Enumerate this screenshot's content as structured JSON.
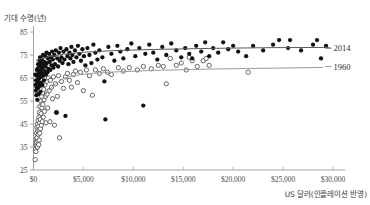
{
  "chart_data": {
    "type": "scatter",
    "title": "",
    "xlabel": "US 달러(인플레이션 반영)",
    "ylabel": "기대 수명(년)",
    "xlim": [
      0,
      30000
    ],
    "ylim": [
      25,
      85
    ],
    "xticks": [
      0,
      5000,
      10000,
      15000,
      20000,
      25000,
      30000
    ],
    "xtick_labels": [
      "$0",
      "$5,000",
      "$10,000",
      "$15,000",
      "$20,000",
      "$25,000",
      "$30,000"
    ],
    "yticks": [
      25,
      35,
      45,
      55,
      65,
      75,
      85
    ],
    "ytick_labels": [
      "25",
      "35",
      "45",
      "55",
      "65",
      "75",
      "85"
    ],
    "grid": false,
    "legend_position": "right-inline",
    "series": [
      {
        "name": "2014",
        "marker": "filled-circle",
        "color": "#111111",
        "label_x": 29400,
        "label_y": 78.0,
        "points": [
          [
            180,
            66.5
          ],
          [
            210,
            62.0
          ],
          [
            240,
            59.5
          ],
          [
            260,
            64.0
          ],
          [
            290,
            57.5
          ],
          [
            300,
            66.0
          ],
          [
            320,
            61.0
          ],
          [
            340,
            68.5
          ],
          [
            360,
            63.5
          ],
          [
            380,
            55.5
          ],
          [
            400,
            69.0
          ],
          [
            420,
            66.0
          ],
          [
            440,
            60.5
          ],
          [
            460,
            71.0
          ],
          [
            480,
            64.5
          ],
          [
            500,
            58.0
          ],
          [
            520,
            67.5
          ],
          [
            540,
            62.5
          ],
          [
            560,
            70.0
          ],
          [
            580,
            65.0
          ],
          [
            600,
            72.5
          ],
          [
            620,
            68.0
          ],
          [
            640,
            61.5
          ],
          [
            660,
            74.0
          ],
          [
            680,
            66.5
          ],
          [
            700,
            59.0
          ],
          [
            720,
            70.5
          ],
          [
            740,
            63.0
          ],
          [
            760,
            68.5
          ],
          [
            780,
            71.5
          ],
          [
            800,
            65.5
          ],
          [
            830,
            73.0
          ],
          [
            860,
            67.0
          ],
          [
            890,
            62.0
          ],
          [
            920,
            69.5
          ],
          [
            950,
            75.0
          ],
          [
            980,
            66.0
          ],
          [
            1010,
            71.0
          ],
          [
            1050,
            64.0
          ],
          [
            1090,
            72.0
          ],
          [
            1130,
            68.0
          ],
          [
            1170,
            74.5
          ],
          [
            1210,
            70.0
          ],
          [
            1250,
            66.5
          ],
          [
            1300,
            76.0
          ],
          [
            1350,
            71.5
          ],
          [
            1400,
            67.5
          ],
          [
            1450,
            73.5
          ],
          [
            1500,
            69.0
          ],
          [
            1560,
            75.5
          ],
          [
            1620,
            72.0
          ],
          [
            1680,
            68.5
          ],
          [
            1740,
            74.0
          ],
          [
            1800,
            70.5
          ],
          [
            1870,
            76.5
          ],
          [
            1930,
            73.0
          ],
          [
            2000,
            69.5
          ],
          [
            2080,
            75.0
          ],
          [
            2150,
            71.0
          ],
          [
            2230,
            77.0
          ],
          [
            2300,
            50.0
          ],
          [
            2380,
            73.5
          ],
          [
            2460,
            70.0
          ],
          [
            2540,
            76.0
          ],
          [
            2620,
            72.5
          ],
          [
            2700,
            78.0
          ],
          [
            2800,
            74.0
          ],
          [
            2900,
            71.5
          ],
          [
            3000,
            76.5
          ],
          [
            3100,
            73.0
          ],
          [
            3200,
            48.5
          ],
          [
            3300,
            77.5
          ],
          [
            3400,
            74.5
          ],
          [
            3500,
            71.0
          ],
          [
            3600,
            76.0
          ],
          [
            3700,
            73.5
          ],
          [
            3800,
            78.5
          ],
          [
            3900,
            75.0
          ],
          [
            4000,
            72.0
          ],
          [
            4150,
            77.0
          ],
          [
            4300,
            74.0
          ],
          [
            4450,
            79.0
          ],
          [
            4600,
            75.5
          ],
          [
            4750,
            72.5
          ],
          [
            4900,
            77.5
          ],
          [
            5050,
            74.5
          ],
          [
            5200,
            70.5
          ],
          [
            5400,
            78.0
          ],
          [
            5600,
            75.0
          ],
          [
            5800,
            71.5
          ],
          [
            6000,
            79.5
          ],
          [
            6200,
            76.0
          ],
          [
            6400,
            73.0
          ],
          [
            6600,
            77.0
          ],
          [
            6900,
            74.0
          ],
          [
            7100,
            63.5
          ],
          [
            7200,
            47.0
          ],
          [
            7500,
            78.5
          ],
          [
            7800,
            75.5
          ],
          [
            8100,
            72.5
          ],
          [
            8400,
            79.0
          ],
          [
            8700,
            76.5
          ],
          [
            9000,
            73.5
          ],
          [
            9400,
            77.5
          ],
          [
            9800,
            80.0
          ],
          [
            10200,
            74.5
          ],
          [
            10600,
            78.0
          ],
          [
            11000,
            53.0
          ],
          [
            11200,
            75.5
          ],
          [
            11600,
            79.5
          ],
          [
            12000,
            76.0
          ],
          [
            12400,
            73.0
          ],
          [
            12900,
            78.5
          ],
          [
            13300,
            75.0
          ],
          [
            13800,
            80.0
          ],
          [
            14300,
            77.0
          ],
          [
            14800,
            74.0
          ],
          [
            15200,
            78.0
          ],
          [
            15600,
            75.5
          ],
          [
            15900,
            73.5
          ],
          [
            16300,
            79.0
          ],
          [
            16800,
            76.5
          ],
          [
            17200,
            80.5
          ],
          [
            17600,
            74.5
          ],
          [
            18000,
            78.0
          ],
          [
            18500,
            76.0
          ],
          [
            19000,
            80.5
          ],
          [
            19500,
            77.5
          ],
          [
            20000,
            79.0
          ],
          [
            20500,
            76.5
          ],
          [
            21300,
            74.5
          ],
          [
            22000,
            79.0
          ],
          [
            23000,
            77.0
          ],
          [
            24000,
            79.5
          ],
          [
            24600,
            81.5
          ],
          [
            25500,
            78.0
          ],
          [
            25700,
            81.5
          ],
          [
            26800,
            77.0
          ],
          [
            28000,
            79.5
          ],
          [
            28400,
            81.5
          ],
          [
            28800,
            73.5
          ],
          [
            29300,
            79.0
          ]
        ],
        "trend": [
          [
            250,
            72.8
          ],
          [
            1500,
            74.2
          ],
          [
            3000,
            75.3
          ],
          [
            5000,
            76.2
          ],
          [
            8000,
            76.9
          ],
          [
            12000,
            77.4
          ],
          [
            18000,
            77.9
          ],
          [
            24000,
            78.2
          ],
          [
            29600,
            78.3
          ]
        ]
      },
      {
        "name": "1960",
        "marker": "open-circle",
        "color": "#111111",
        "label_x": 29400,
        "label_y": 70.0,
        "points": [
          [
            170,
            29.5
          ],
          [
            200,
            34.0
          ],
          [
            220,
            36.5
          ],
          [
            240,
            33.0
          ],
          [
            260,
            38.5
          ],
          [
            280,
            35.5
          ],
          [
            300,
            41.0
          ],
          [
            320,
            37.0
          ],
          [
            340,
            43.5
          ],
          [
            360,
            39.0
          ],
          [
            380,
            45.0
          ],
          [
            400,
            35.0
          ],
          [
            420,
            42.0
          ],
          [
            440,
            37.5
          ],
          [
            460,
            46.5
          ],
          [
            480,
            40.5
          ],
          [
            500,
            44.0
          ],
          [
            520,
            36.0
          ],
          [
            540,
            48.0
          ],
          [
            560,
            42.5
          ],
          [
            580,
            38.0
          ],
          [
            600,
            50.0
          ],
          [
            620,
            45.5
          ],
          [
            640,
            41.0
          ],
          [
            660,
            52.5
          ],
          [
            680,
            47.0
          ],
          [
            700,
            43.0
          ],
          [
            730,
            55.0
          ],
          [
            760,
            49.5
          ],
          [
            790,
            44.5
          ],
          [
            820,
            57.0
          ],
          [
            850,
            52.0
          ],
          [
            880,
            46.0
          ],
          [
            910,
            58.5
          ],
          [
            940,
            53.5
          ],
          [
            980,
            48.0
          ],
          [
            1020,
            60.0
          ],
          [
            1060,
            55.5
          ],
          [
            1100,
            50.5
          ],
          [
            1150,
            62.0
          ],
          [
            1200,
            57.0
          ],
          [
            1250,
            45.5
          ],
          [
            1300,
            63.5
          ],
          [
            1360,
            58.0
          ],
          [
            1420,
            52.0
          ],
          [
            1500,
            65.0
          ],
          [
            1570,
            59.5
          ],
          [
            1650,
            46.0
          ],
          [
            1700,
            64.0
          ],
          [
            1800,
            61.0
          ],
          [
            1900,
            56.0
          ],
          [
            2000,
            65.5
          ],
          [
            2100,
            44.5
          ],
          [
            2200,
            62.5
          ],
          [
            2300,
            50.0
          ],
          [
            2400,
            57.0
          ],
          [
            2500,
            66.0
          ],
          [
            2600,
            39.0
          ],
          [
            2800,
            63.5
          ],
          [
            3000,
            60.5
          ],
          [
            3200,
            65.5
          ],
          [
            3400,
            67.0
          ],
          [
            3600,
            64.0
          ],
          [
            3800,
            61.0
          ],
          [
            4000,
            66.5
          ],
          [
            4200,
            68.0
          ],
          [
            4400,
            63.0
          ],
          [
            4700,
            67.5
          ],
          [
            5000,
            59.5
          ],
          [
            5300,
            68.5
          ],
          [
            5600,
            66.0
          ],
          [
            5900,
            57.5
          ],
          [
            6200,
            68.5
          ],
          [
            6600,
            67.0
          ],
          [
            7000,
            69.0
          ],
          [
            7400,
            67.5
          ],
          [
            7800,
            66.5
          ],
          [
            8500,
            69.5
          ],
          [
            9000,
            68.0
          ],
          [
            9600,
            69.5
          ],
          [
            10400,
            68.5
          ],
          [
            11000,
            70.0
          ],
          [
            11800,
            69.0
          ],
          [
            12500,
            70.5
          ],
          [
            13000,
            70.0
          ],
          [
            13300,
            62.5
          ],
          [
            13700,
            73.5
          ],
          [
            14300,
            70.5
          ],
          [
            14800,
            71.5
          ],
          [
            15300,
            68.5
          ],
          [
            15600,
            74.0
          ],
          [
            15900,
            72.5
          ],
          [
            16400,
            70.0
          ],
          [
            17000,
            72.5
          ],
          [
            17300,
            73.5
          ],
          [
            17600,
            70.5
          ],
          [
            21500,
            67.5
          ]
        ],
        "trend": [
          [
            250,
            52.0
          ],
          [
            800,
            55.0
          ],
          [
            1500,
            59.5
          ],
          [
            2200,
            62.5
          ],
          [
            3000,
            64.8
          ],
          [
            4000,
            66.0
          ],
          [
            5500,
            66.9
          ],
          [
            8000,
            67.6
          ],
          [
            12000,
            68.3
          ],
          [
            18000,
            68.9
          ],
          [
            24000,
            69.3
          ],
          [
            29000,
            69.6
          ]
        ]
      }
    ]
  }
}
